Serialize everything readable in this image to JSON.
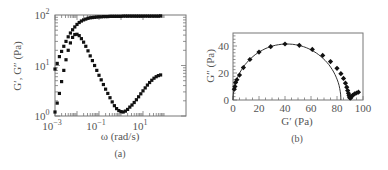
{
  "chart_data": [
    {
      "panel": "(a)",
      "type": "scatter",
      "caption": "(a)",
      "xlabel": "ω (rad/s)",
      "ylabel": "G′, G″ (Pa)",
      "xscale": "log",
      "yscale": "log",
      "xlim": [
        0.001,
        60
      ],
      "ylim": [
        1,
        100
      ],
      "xticks": [
        {
          "value": 0.001,
          "base": "10",
          "exp": "−3"
        },
        {
          "value": 0.1,
          "base": "10",
          "exp": "−1"
        },
        {
          "value": 10,
          "base": "10",
          "exp": "1"
        }
      ],
      "yticks": [
        {
          "value": 1,
          "base": "10",
          "exp": "0"
        },
        {
          "value": 10,
          "base": "10",
          "exp": "1"
        },
        {
          "value": 100,
          "base": "10",
          "exp": "2"
        }
      ],
      "grid": false,
      "series": [
        {
          "name": "G′",
          "marker": "square",
          "logx": [
            -3.0,
            -2.9,
            -2.8,
            -2.7,
            -2.6,
            -2.5,
            -2.4,
            -2.3,
            -2.2,
            -2.1,
            -2.0,
            -1.9,
            -1.8,
            -1.7,
            -1.6,
            -1.5,
            -1.4,
            -1.3,
            -1.2,
            -1.1,
            -1.0,
            -0.9,
            -0.8,
            -0.7,
            -0.6,
            -0.5,
            -0.4,
            -0.3,
            -0.2,
            -0.1,
            0.0,
            0.1,
            0.2,
            0.3,
            0.4,
            0.5,
            0.6,
            0.7,
            0.8,
            0.9,
            1.0,
            1.1,
            1.2,
            1.3,
            1.4,
            1.5,
            1.6,
            1.7,
            1.8
          ],
          "values": [
            8.5,
            11,
            15,
            19,
            24,
            30,
            37,
            44,
            51,
            58,
            65,
            71,
            76,
            80,
            83,
            86,
            88,
            89,
            90,
            91,
            92,
            92,
            93,
            93,
            93,
            94,
            94,
            94,
            94,
            94,
            94,
            95,
            95,
            95,
            95,
            95,
            95,
            95,
            95,
            95,
            95,
            95,
            95,
            95,
            95,
            95,
            95,
            95,
            96
          ]
        },
        {
          "name": "G″",
          "marker": "square",
          "logx": [
            -3.0,
            -2.9,
            -2.8,
            -2.7,
            -2.6,
            -2.5,
            -2.4,
            -2.3,
            -2.2,
            -2.1,
            -2.0,
            -1.9,
            -1.8,
            -1.7,
            -1.6,
            -1.5,
            -1.4,
            -1.3,
            -1.2,
            -1.1,
            -1.0,
            -0.9,
            -0.8,
            -0.7,
            -0.6,
            -0.5,
            -0.4,
            -0.3,
            -0.2,
            -0.1,
            0.0,
            0.1,
            0.2,
            0.3,
            0.4,
            0.5,
            0.6,
            0.7,
            0.8,
            0.9,
            1.0,
            1.1,
            1.2,
            1.3,
            1.4,
            1.5,
            1.6,
            1.7,
            1.8
          ],
          "values": [
            1.2,
            1.8,
            2.8,
            4.8,
            8,
            13,
            20,
            28,
            36,
            41,
            41.5,
            39,
            34,
            29,
            24,
            19.5,
            15.5,
            12.5,
            10,
            8,
            6.4,
            5.2,
            4.2,
            3.4,
            2.8,
            2.3,
            1.9,
            1.6,
            1.4,
            1.28,
            1.22,
            1.2,
            1.25,
            1.35,
            1.5,
            1.65,
            1.85,
            2.1,
            2.4,
            2.75,
            3.15,
            3.6,
            4.1,
            4.6,
            5.1,
            5.6,
            6.0,
            6.3,
            6.5
          ]
        }
      ]
    },
    {
      "panel": "(b)",
      "type": "scatter",
      "caption": "(b)",
      "xlabel": "G′ (Pa)",
      "ylabel": "G″ (Pa)",
      "xlim": [
        0,
        100
      ],
      "ylim": [
        0,
        50
      ],
      "xticks": [
        0,
        20,
        40,
        60,
        80,
        100
      ],
      "yticks": [
        0,
        20,
        40
      ],
      "grid": false,
      "series": [
        {
          "name": "data",
          "marker": "diamond",
          "x": [
            1,
            1.5,
            2,
            3,
            5,
            8,
            13,
            20,
            29,
            40,
            51,
            61,
            69,
            75,
            80,
            83,
            85,
            86.5,
            87.5,
            88.2,
            88.8,
            89.2,
            89.6,
            90,
            90.5,
            91,
            92,
            93.5,
            95,
            96.5
          ],
          "y": [
            8,
            10,
            13,
            15,
            18.5,
            24,
            30,
            35.5,
            39.5,
            41.5,
            40.5,
            37.5,
            33,
            28.5,
            23.5,
            19.5,
            16,
            12.5,
            9.5,
            7,
            5,
            3.5,
            2.2,
            1.5,
            1.5,
            2.5,
            3.5,
            4.5,
            5.2,
            5.8
          ]
        },
        {
          "name": "semicircle fit",
          "type": "line",
          "center": [
            41.5,
            0
          ],
          "radius": 41.5
        }
      ]
    }
  ]
}
